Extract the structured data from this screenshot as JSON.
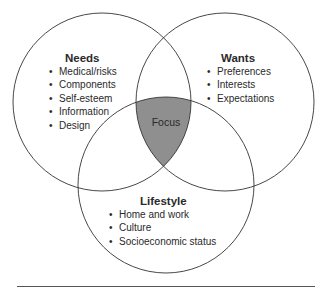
{
  "diagram": {
    "type": "venn",
    "circles": [
      {
        "id": "needs",
        "title": "Needs",
        "items": [
          "Medical/risks",
          "Components",
          "Self-esteem",
          "Information",
          "Design"
        ]
      },
      {
        "id": "wants",
        "title": "Wants",
        "items": [
          "Preferences",
          "Interests",
          "Expectations"
        ]
      },
      {
        "id": "lifestyle",
        "title": "Lifestyle",
        "items": [
          "Home and work",
          "Culture",
          "Socioeconomic status"
        ]
      }
    ],
    "intersection": {
      "label": "Focus",
      "fill": "#8f8f8f"
    },
    "stroke_color": "#333333"
  }
}
